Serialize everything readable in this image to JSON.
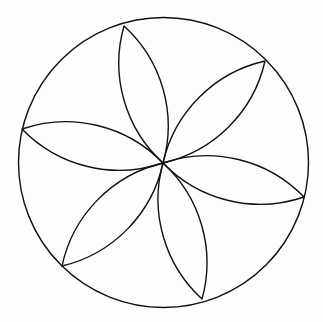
{
  "figure": {
    "colors": {
      "stroke": "#111111",
      "background": "#fdfdfd"
    },
    "circle": {
      "cx": 163.5,
      "cy": 162.5,
      "r": 145
    },
    "center": {
      "x": 163,
      "y": 163
    },
    "petal_arc_radius": 135,
    "petals": [
      {
        "tip": {
          "x": 124,
          "y": 26
        }
      },
      {
        "tip": {
          "x": 265,
          "y": 61
        }
      },
      {
        "tip": {
          "x": 304,
          "y": 197
        }
      },
      {
        "tip": {
          "x": 202,
          "y": 299
        }
      },
      {
        "tip": {
          "x": 62,
          "y": 266
        }
      },
      {
        "tip": {
          "x": 22,
          "y": 129
        }
      }
    ]
  }
}
